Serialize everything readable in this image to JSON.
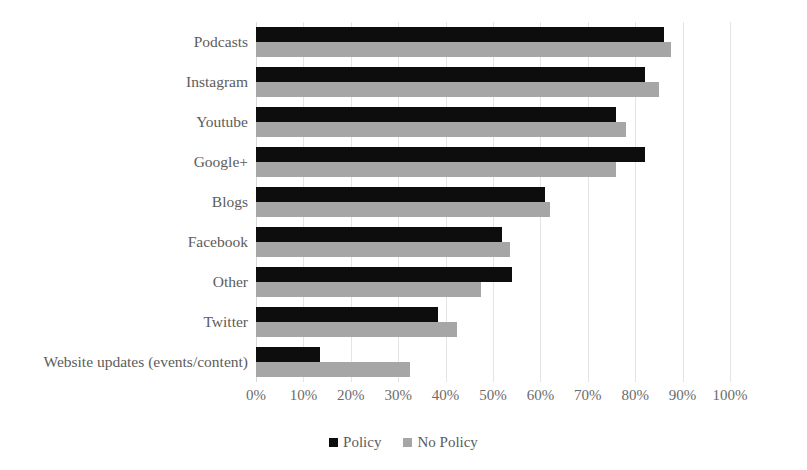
{
  "chart_data": {
    "type": "bar",
    "orientation": "horizontal",
    "title": "",
    "subtitle": "",
    "xlabel": "",
    "ylabel": "",
    "xlim": [
      0,
      100
    ],
    "xtick_labels": [
      "0%",
      "10%",
      "20%",
      "30%",
      "40%",
      "50%",
      "60%",
      "70%",
      "80%",
      "90%",
      "100%"
    ],
    "xtick_values": [
      0,
      10,
      20,
      30,
      40,
      50,
      60,
      70,
      80,
      90,
      100
    ],
    "grid": true,
    "legend_position": "bottom",
    "categories": [
      "Podcasts",
      "Instagram",
      "Youtube",
      "Google+",
      "Blogs",
      "Facebook",
      "Other",
      "Twitter",
      "Website updates (events/content)"
    ],
    "series": [
      {
        "name": "Policy",
        "color": "#0d0d0d",
        "values": [
          86,
          82,
          76,
          82,
          61,
          52,
          54,
          38.5,
          13.5
        ]
      },
      {
        "name": "No Policy",
        "color": "#a6a6a6",
        "values": [
          87.5,
          85,
          78,
          76,
          62,
          53.5,
          47.5,
          42.5,
          32.5
        ]
      }
    ]
  },
  "legend": {
    "items": [
      {
        "label": "Policy",
        "color": "#0d0d0d"
      },
      {
        "label": "No Policy",
        "color": "#a6a6a6"
      }
    ]
  }
}
